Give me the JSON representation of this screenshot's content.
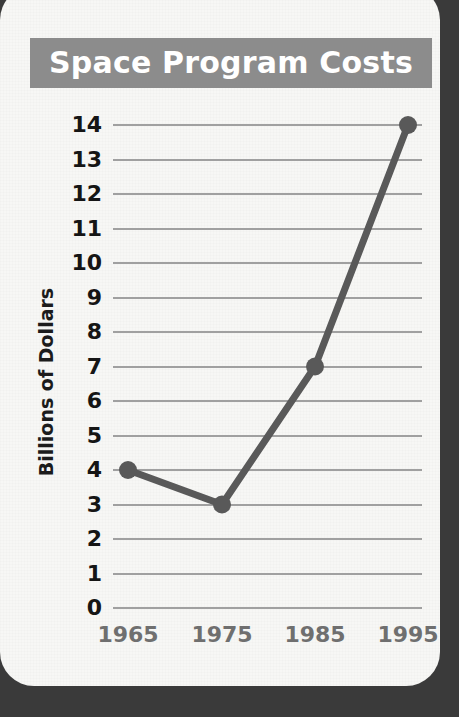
{
  "chart_data": {
    "type": "line",
    "title": "Space Program Costs",
    "xlabel": "",
    "ylabel": "Billions of Dollars",
    "categories": [
      "1965",
      "1975",
      "1985",
      "1995"
    ],
    "x": [
      1965,
      1975,
      1985,
      1995
    ],
    "values": [
      4,
      3,
      7,
      14
    ],
    "series": [
      {
        "name": "Space Program Costs",
        "values": [
          4,
          3,
          7,
          14
        ]
      }
    ],
    "ylim": [
      0,
      14
    ],
    "ytick_labels": [
      "14",
      "13",
      "12",
      "11",
      "10",
      "9",
      "8",
      "7",
      "6",
      "5",
      "4",
      "3",
      "2",
      "1",
      "0"
    ],
    "ytick_values": [
      14,
      13,
      12,
      11,
      10,
      9,
      8,
      7,
      6,
      5,
      4,
      3,
      2,
      1,
      0
    ],
    "ytick_step": 1,
    "xtick_labels": [
      "1965",
      "1975",
      "1985",
      "1995"
    ],
    "grid": "horizontal",
    "legend": "none",
    "marker": "circle",
    "colors": {
      "title_bar": "#8c8c8c",
      "title_text": "#ffffff",
      "series_line": "#595959",
      "marker": "#595959",
      "gridline": "#a0a0a0",
      "ytick_text": "#151515",
      "xtick_text": "#6f6f6f",
      "axis_label": "#1c1c1c",
      "card_background": "#f7f7f5",
      "page_background": "#3a3a3a"
    }
  }
}
